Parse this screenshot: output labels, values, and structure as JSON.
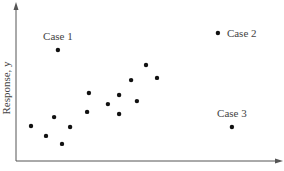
{
  "chart_data": {
    "type": "scatter",
    "title": "",
    "xlabel": "Explanatory, x",
    "ylabel": "Response, y",
    "xlim": [
      0,
      10
    ],
    "ylim": [
      0,
      10
    ],
    "grid": false,
    "ticks": false,
    "legend": null,
    "series": [
      {
        "name": "observations",
        "points": [
          {
            "x": 0.59,
            "y": 2.32
          },
          {
            "x": 1.18,
            "y": 1.66
          },
          {
            "x": 1.5,
            "y": 2.91
          },
          {
            "x": 1.81,
            "y": 1.13
          },
          {
            "x": 2.13,
            "y": 2.25
          },
          {
            "x": 2.8,
            "y": 3.25
          },
          {
            "x": 2.87,
            "y": 4.5
          },
          {
            "x": 3.62,
            "y": 3.77
          },
          {
            "x": 4.06,
            "y": 4.37
          },
          {
            "x": 4.06,
            "y": 3.11
          },
          {
            "x": 4.53,
            "y": 5.36
          },
          {
            "x": 4.76,
            "y": 3.97
          },
          {
            "x": 5.12,
            "y": 6.36
          },
          {
            "x": 5.55,
            "y": 5.5
          }
        ]
      },
      {
        "name": "labeled cases",
        "points": [
          {
            "x": 1.65,
            "y": 7.35,
            "label": "Case 1",
            "label_pos": "above"
          },
          {
            "x": 7.95,
            "y": 8.48,
            "label": "Case 2",
            "label_pos": "right"
          },
          {
            "x": 8.5,
            "y": 2.25,
            "label": "Case 3",
            "label_pos": "above"
          }
        ]
      }
    ],
    "annotations": [
      "Case 1",
      "Case 2",
      "Case 3"
    ]
  },
  "colors": {
    "axis": "#555555",
    "point": "#111111",
    "text": "#444444"
  }
}
